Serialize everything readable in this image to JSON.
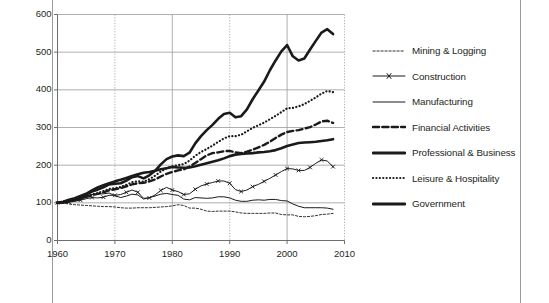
{
  "chart_data": {
    "type": "line",
    "title": "",
    "xlabel": "",
    "ylabel": "",
    "xlim": [
      1960,
      2010
    ],
    "ylim": [
      0,
      600
    ],
    "xticks": [
      1960,
      1970,
      1980,
      1990,
      2000,
      2010
    ],
    "yticks": [
      0,
      100,
      200,
      300,
      400,
      500,
      600
    ],
    "grid": true,
    "legend_position": "right",
    "x": [
      1960,
      1961,
      1962,
      1963,
      1964,
      1965,
      1966,
      1967,
      1968,
      1969,
      1970,
      1971,
      1972,
      1973,
      1974,
      1975,
      1976,
      1977,
      1978,
      1979,
      1980,
      1981,
      1982,
      1983,
      1984,
      1985,
      1986,
      1987,
      1988,
      1989,
      1990,
      1991,
      1992,
      1993,
      1994,
      1995,
      1996,
      1997,
      1998,
      1999,
      2000,
      2001,
      2002,
      2003,
      2004,
      2005,
      2006,
      2007,
      2008
    ],
    "series": [
      {
        "name": "Mining & Logging",
        "style": "fine-dashed",
        "width": 0.9,
        "values": [
          100,
          99,
          97,
          95,
          94,
          93,
          92,
          91,
          90,
          90,
          89,
          87,
          86,
          86,
          87,
          87,
          87,
          88,
          89,
          90,
          92,
          95,
          93,
          86,
          86,
          83,
          78,
          77,
          78,
          78,
          78,
          76,
          73,
          72,
          72,
          72,
          72,
          73,
          73,
          69,
          68,
          68,
          64,
          63,
          64,
          66,
          69,
          70,
          72
        ]
      },
      {
        "name": "Construction",
        "style": "thin-marker-x",
        "width": 1.0,
        "values": [
          100,
          99,
          102,
          104,
          107,
          111,
          114,
          113,
          115,
          120,
          120,
          122,
          128,
          134,
          128,
          112,
          113,
          121,
          133,
          141,
          134,
          130,
          122,
          124,
          136,
          145,
          150,
          154,
          158,
          158,
          152,
          135,
          130,
          134,
          143,
          149,
          157,
          165,
          174,
          183,
          191,
          190,
          186,
          186,
          194,
          205,
          214,
          211,
          196
        ]
      },
      {
        "name": "Manufacturing",
        "style": "thin-solid",
        "width": 1.0,
        "values": [
          100,
          99,
          103,
          105,
          109,
          115,
          122,
          123,
          124,
          126,
          119,
          114,
          118,
          123,
          121,
          110,
          114,
          118,
          123,
          125,
          122,
          120,
          110,
          108,
          114,
          113,
          112,
          113,
          116,
          116,
          113,
          107,
          104,
          104,
          107,
          108,
          107,
          109,
          109,
          106,
          105,
          97,
          91,
          87,
          87,
          87,
          87,
          86,
          83
        ]
      },
      {
        "name": "Financial Activities",
        "style": "bold-dashed",
        "width": 2.4,
        "values": [
          100,
          102,
          105,
          108,
          112,
          116,
          120,
          124,
          128,
          133,
          136,
          139,
          144,
          149,
          152,
          153,
          157,
          162,
          170,
          177,
          182,
          186,
          189,
          196,
          206,
          216,
          226,
          232,
          234,
          237,
          238,
          234,
          232,
          236,
          241,
          247,
          254,
          262,
          272,
          281,
          288,
          291,
          293,
          297,
          301,
          308,
          316,
          318,
          312
        ]
      },
      {
        "name": "Professional & Business",
        "style": "bold-solid",
        "width": 2.6,
        "values": [
          100,
          102,
          106,
          110,
          115,
          122,
          130,
          135,
          141,
          149,
          151,
          152,
          159,
          168,
          171,
          165,
          173,
          185,
          202,
          216,
          223,
          226,
          224,
          233,
          258,
          277,
          293,
          307,
          323,
          336,
          339,
          327,
          330,
          348,
          375,
          398,
          422,
          452,
          478,
          502,
          519,
          489,
          478,
          483,
          507,
          530,
          552,
          561,
          548
        ]
      },
      {
        "name": "Leisure & Hospitality",
        "style": "dotted",
        "width": 2.2,
        "values": [
          100,
          101,
          104,
          107,
          111,
          117,
          122,
          126,
          131,
          137,
          139,
          142,
          148,
          155,
          157,
          156,
          163,
          172,
          183,
          192,
          197,
          200,
          203,
          212,
          225,
          235,
          243,
          252,
          262,
          271,
          277,
          277,
          281,
          290,
          299,
          306,
          313,
          322,
          331,
          341,
          351,
          352,
          356,
          362,
          371,
          380,
          390,
          397,
          394
        ]
      },
      {
        "name": "Government",
        "style": "bold-solid",
        "width": 2.6,
        "values": [
          100,
          103,
          108,
          112,
          118,
          124,
          133,
          141,
          147,
          152,
          157,
          161,
          166,
          171,
          176,
          180,
          182,
          185,
          189,
          192,
          195,
          194,
          193,
          194,
          197,
          201,
          205,
          209,
          213,
          218,
          224,
          228,
          230,
          231,
          232,
          234,
          235,
          237,
          240,
          245,
          251,
          255,
          259,
          260,
          261,
          262,
          264,
          266,
          269
        ]
      }
    ]
  },
  "legend": {
    "items": [
      {
        "label": "Mining & Logging",
        "key": "fine-dashed-key"
      },
      {
        "label": "Construction",
        "key": "thin-marker-x-key"
      },
      {
        "label": "Manufacturing",
        "key": "thin-solid-key"
      },
      {
        "label": "Financial Activities",
        "key": "bold-dashed-key"
      },
      {
        "label": "Professional & Business",
        "key": "bold-solid-key"
      },
      {
        "label": "Leisure & Hospitality",
        "key": "dotted-key"
      },
      {
        "label": "Government",
        "key": "bold-solid-key"
      }
    ]
  },
  "colors": {
    "line": "#1a1a1a",
    "grid": "#9a9a9a",
    "axis": "#6e6e6e",
    "text": "#231f20",
    "background": "#ffffff"
  }
}
